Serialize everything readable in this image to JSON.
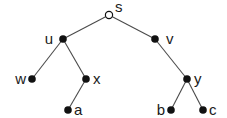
{
  "diagram": {
    "type": "tree",
    "root": "s",
    "edge_color": "#4a4a4a",
    "node_color": "#111111",
    "nodes": [
      {
        "id": "s",
        "label": "s",
        "x": 109,
        "y": 15,
        "open": true,
        "lx": 115,
        "ly": 12,
        "anchor": "start"
      },
      {
        "id": "u",
        "label": "u",
        "x": 63,
        "y": 39,
        "open": false,
        "lx": 53,
        "ly": 44,
        "anchor": "end"
      },
      {
        "id": "v",
        "label": "v",
        "x": 155,
        "y": 39,
        "open": false,
        "lx": 166,
        "ly": 44,
        "anchor": "start"
      },
      {
        "id": "w",
        "label": "w",
        "x": 32,
        "y": 79,
        "open": false,
        "lx": 26,
        "ly": 84,
        "anchor": "end"
      },
      {
        "id": "x",
        "label": "x",
        "x": 86,
        "y": 79,
        "open": false,
        "lx": 93,
        "ly": 84,
        "anchor": "start"
      },
      {
        "id": "a",
        "label": "a",
        "x": 68,
        "y": 110,
        "open": false,
        "lx": 74,
        "ly": 115,
        "anchor": "start"
      },
      {
        "id": "y",
        "label": "y",
        "x": 187,
        "y": 79,
        "open": false,
        "lx": 194,
        "ly": 84,
        "anchor": "start"
      },
      {
        "id": "b",
        "label": "b",
        "x": 171,
        "y": 110,
        "open": false,
        "lx": 165,
        "ly": 115,
        "anchor": "end"
      },
      {
        "id": "c",
        "label": "c",
        "x": 203,
        "y": 110,
        "open": false,
        "lx": 209,
        "ly": 115,
        "anchor": "start"
      }
    ],
    "edges": [
      [
        "s",
        "u"
      ],
      [
        "s",
        "v"
      ],
      [
        "u",
        "w"
      ],
      [
        "u",
        "x"
      ],
      [
        "x",
        "a"
      ],
      [
        "v",
        "y"
      ],
      [
        "y",
        "b"
      ],
      [
        "y",
        "c"
      ]
    ]
  }
}
